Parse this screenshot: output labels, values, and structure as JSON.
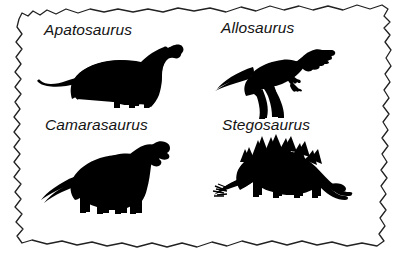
{
  "figure": {
    "kind": "torn-paper-sheet",
    "background_color": "#ffffff",
    "paper_color": "#ffffff",
    "edge_color": "#222222",
    "silhouette_color": "#000000",
    "width": 400,
    "height": 261
  },
  "specimens": [
    {
      "id": "apatosaurus",
      "label": "Apatosaurus",
      "icon": "apatosaurus-silhouette",
      "facing": "right",
      "group": "sauropod",
      "cell": "top-left"
    },
    {
      "id": "allosaurus",
      "label": "Allosaurus",
      "icon": "allosaurus-silhouette",
      "facing": "right",
      "group": "theropod",
      "cell": "top-right"
    },
    {
      "id": "camarasaurus",
      "label": "Camarasaurus",
      "icon": "camarasaurus-silhouette",
      "facing": "right",
      "group": "sauropod",
      "cell": "bottom-left"
    },
    {
      "id": "stegosaurus",
      "label": "Stegosaurus",
      "icon": "stegosaurus-silhouette",
      "facing": "right",
      "group": "stegosaur",
      "cell": "bottom-right"
    }
  ]
}
